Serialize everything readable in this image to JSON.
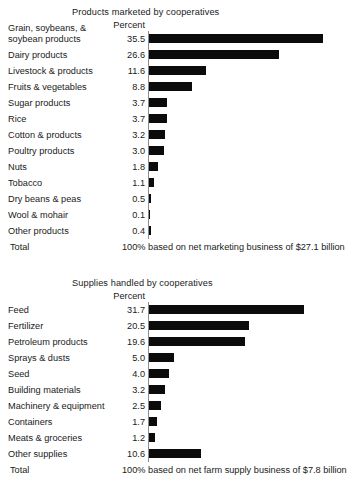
{
  "chart_data": [
    {
      "type": "bar",
      "orientation": "horizontal",
      "title": "Products marketed by cooperatives",
      "xlabel": "Percent",
      "ylabel": "",
      "value_header": "Percent",
      "grid": false,
      "legend": false,
      "xlim": [
        0,
        35.5
      ],
      "categories": [
        "Grain, soybeans, & soybean products",
        "Dairy products",
        "Livestock & products",
        "Fruits & vegetables",
        "Sugar products",
        "Rice",
        "Cotton & products",
        "Poultry products",
        "Nuts",
        "Tobacco",
        "Dry beans & peas",
        "Wool & mohair",
        "Other products"
      ],
      "values": [
        35.5,
        26.6,
        11.6,
        8.8,
        3.7,
        3.7,
        3.2,
        3.0,
        1.8,
        1.1,
        0.5,
        0.1,
        0.4
      ],
      "value_labels": [
        "35.5",
        "26.6",
        "11.6",
        "8.8",
        "3.7",
        "3.7",
        "3.2",
        "3.0",
        "1.8",
        "1.1",
        "0.5",
        "0.1",
        "0.4"
      ],
      "total_label": "Total",
      "total_note": "100% based on net marketing business of $27.1 billion"
    },
    {
      "type": "bar",
      "orientation": "horizontal",
      "title": "Supplies handled by cooperatives",
      "xlabel": "Percent",
      "ylabel": "",
      "value_header": "Percent",
      "grid": false,
      "legend": false,
      "xlim": [
        0,
        31.7
      ],
      "categories": [
        "Feed",
        "Fertilizer",
        "Petroleum products",
        "Sprays & dusts",
        "Seed",
        "Building materials",
        "Machinery & equipment",
        "Containers",
        "Meats & groceries",
        "Other supplies"
      ],
      "values": [
        31.7,
        20.5,
        19.6,
        5.0,
        4.0,
        3.2,
        2.5,
        1.7,
        1.2,
        10.6
      ],
      "value_labels": [
        "31.7",
        "20.5",
        "19.6",
        "5.0",
        "4.0",
        "3.2",
        "2.5",
        "1.7",
        "1.2",
        "10.6"
      ],
      "total_label": "Total",
      "total_note": "100% based on net farm supply business of $7.8 billion"
    }
  ],
  "style": {
    "bar_color": "#0b0b0b",
    "axis_color": "#8c8c8c",
    "text_color": "#1a1a1a",
    "background": "#ffffff",
    "px_per_percent": 4.9
  }
}
